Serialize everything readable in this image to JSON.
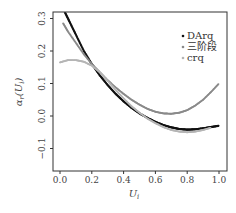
{
  "chart_data": {
    "type": "scatter",
    "title": "",
    "xlabel": "U_i",
    "ylabel": "α_r(U_i)",
    "xlim": [
      -0.04,
      1.04
    ],
    "ylim": [
      -0.17,
      0.32
    ],
    "xticks": [
      0.0,
      0.2,
      0.4,
      0.6,
      0.8,
      1.0
    ],
    "xtick_labels": [
      "0.0",
      "0.2",
      "0.4",
      "0.6",
      "0.8",
      "1.0"
    ],
    "yticks": [
      -0.1,
      0.0,
      0.1,
      0.2,
      0.3
    ],
    "ytick_labels": [
      "−0.1",
      "0.0",
      "0.1",
      "0.2",
      "0.3"
    ],
    "grid": false,
    "legend_position": "upper right",
    "series": [
      {
        "name": "DArq",
        "color": "#111111",
        "x": [
          0.03,
          0.06,
          0.1,
          0.15,
          0.2,
          0.25,
          0.3,
          0.35,
          0.4,
          0.45,
          0.5,
          0.55,
          0.6,
          0.65,
          0.7,
          0.75,
          0.8,
          0.85,
          0.9,
          0.95,
          1.0
        ],
        "values": [
          0.32,
          0.29,
          0.25,
          0.2,
          0.16,
          0.125,
          0.095,
          0.068,
          0.045,
          0.025,
          0.008,
          -0.006,
          -0.018,
          -0.028,
          -0.035,
          -0.04,
          -0.042,
          -0.041,
          -0.038,
          -0.034,
          -0.03
        ]
      },
      {
        "name": "三阶段",
        "color": "#8a8a8a",
        "x": [
          0.02,
          0.05,
          0.1,
          0.15,
          0.2,
          0.25,
          0.3,
          0.35,
          0.4,
          0.45,
          0.5,
          0.55,
          0.6,
          0.65,
          0.7,
          0.75,
          0.8,
          0.85,
          0.9,
          0.95,
          1.0
        ],
        "values": [
          0.285,
          0.26,
          0.225,
          0.19,
          0.16,
          0.135,
          0.11,
          0.088,
          0.068,
          0.05,
          0.035,
          0.022,
          0.013,
          0.008,
          0.007,
          0.01,
          0.018,
          0.032,
          0.05,
          0.074,
          0.1
        ]
      },
      {
        "name": "crq",
        "color": "#b5b5b5",
        "x": [
          0.0,
          0.05,
          0.1,
          0.15,
          0.2,
          0.25,
          0.3,
          0.35,
          0.4,
          0.45,
          0.5,
          0.55,
          0.6,
          0.65,
          0.7,
          0.75,
          0.8,
          0.85,
          0.9,
          0.95
        ],
        "values": [
          0.165,
          0.172,
          0.172,
          0.167,
          0.155,
          0.135,
          0.108,
          0.08,
          0.054,
          0.03,
          0.01,
          -0.008,
          -0.022,
          -0.034,
          -0.043,
          -0.048,
          -0.05,
          -0.048,
          -0.043,
          -0.036
        ]
      }
    ]
  },
  "legend": {
    "items": [
      {
        "label": "DArq",
        "color": "#111111"
      },
      {
        "label": "三阶段",
        "color": "#8a8a8a"
      },
      {
        "label": "crq",
        "color": "#b5b5b5"
      }
    ]
  },
  "axes": {
    "xlabel": "U",
    "xlabel_sub": "i",
    "ylabel": "α",
    "ylabel_sub": "r",
    "ylabel_arg": "(U",
    "ylabel_arg_sub": "i",
    "ylabel_close": ")"
  }
}
